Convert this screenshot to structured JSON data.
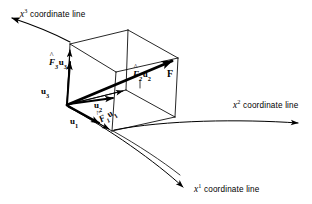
{
  "figure": {
    "background_color": "#ffffff",
    "ink_color": "#000000",
    "width": 312,
    "height": 204
  },
  "axes": [
    {
      "id": "x3",
      "var": "x",
      "superscript": "3",
      "caption": "coordinate line",
      "label_x": 20,
      "label_y": 8,
      "arrow_tip": [
        8,
        15
      ]
    },
    {
      "id": "x2",
      "var": "x",
      "superscript": "2",
      "caption": "coordinate line",
      "label_x": 233,
      "label_y": 99,
      "arrow_tip": [
        303,
        125
      ]
    },
    {
      "id": "x1",
      "var": "x",
      "superscript": "1",
      "caption": "coordinate line",
      "label_x": 194,
      "label_y": 183,
      "arrow_tip": [
        186,
        189
      ]
    }
  ],
  "vectors": [
    {
      "id": "u1",
      "symbol": "u",
      "subscript": "1",
      "label_x": 70,
      "label_y": 117
    },
    {
      "id": "u2",
      "symbol": "u",
      "subscript": "2",
      "label_x": 94,
      "label_y": 101
    },
    {
      "id": "u3",
      "symbol": "u",
      "subscript": "3",
      "label_x": 41,
      "label_y": 87
    },
    {
      "id": "F",
      "symbol": "F",
      "subscript": "",
      "label_x": 167,
      "label_y": 69
    }
  ],
  "components": [
    {
      "id": "F1u1",
      "coefficient": "F",
      "accent": "^",
      "coefficient_subscript": "1",
      "basis": "u",
      "basis_subscript": "1",
      "label_x": 103,
      "label_y": 115
    },
    {
      "id": "F2u2",
      "coefficient": "F",
      "accent": "^",
      "coefficient_subscript": "2",
      "basis": "u",
      "basis_subscript": "2",
      "label_x": 137,
      "label_y": 84
    },
    {
      "id": "F3u3",
      "coefficient": "F",
      "accent": "^",
      "coefficient_subscript": "3",
      "basis": "u",
      "basis_subscript": "3",
      "label_x": 49,
      "label_y": 58
    }
  ],
  "geometry": {
    "origin_vertex": [
      67,
      105
    ],
    "tip_vertex": [
      178,
      58
    ],
    "note": "parallelepiped with one corner at the origin of the curvilinear frame and the opposite corner at the head of F"
  }
}
